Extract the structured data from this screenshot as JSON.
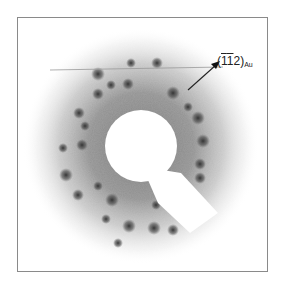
{
  "figure": {
    "type": "electron diffraction pattern",
    "annotation": {
      "index_open": "(",
      "index_h": "1",
      "index_k": "1",
      "index_l": "2",
      "index_close": ")",
      "subscript": "Au",
      "full_text": "(1̄1̄2)Au"
    },
    "colors": {
      "background": "#ffffff",
      "halo": "#9a9a9a",
      "spot": "#3a3a3a",
      "frame": "#8a8a8a"
    },
    "center": [
      123,
      128
    ],
    "beam_stop_radius": 36,
    "spots": [
      [
        113,
        45
      ],
      [
        139,
        45
      ],
      [
        80,
        56
      ],
      [
        93,
        67
      ],
      [
        110,
        66
      ],
      [
        155,
        75
      ],
      [
        170,
        89
      ],
      [
        61,
        95
      ],
      [
        180,
        100
      ],
      [
        67,
        108
      ],
      [
        64,
        127
      ],
      [
        185,
        123
      ],
      [
        45,
        130
      ],
      [
        182,
        146
      ],
      [
        48,
        157
      ],
      [
        80,
        168
      ],
      [
        182,
        160
      ],
      [
        94,
        182
      ],
      [
        138,
        187
      ],
      [
        60,
        177
      ],
      [
        111,
        208
      ],
      [
        88,
        201
      ],
      [
        155,
        212
      ],
      [
        136,
        210
      ],
      [
        100,
        225
      ],
      [
        80,
        76
      ]
    ]
  }
}
